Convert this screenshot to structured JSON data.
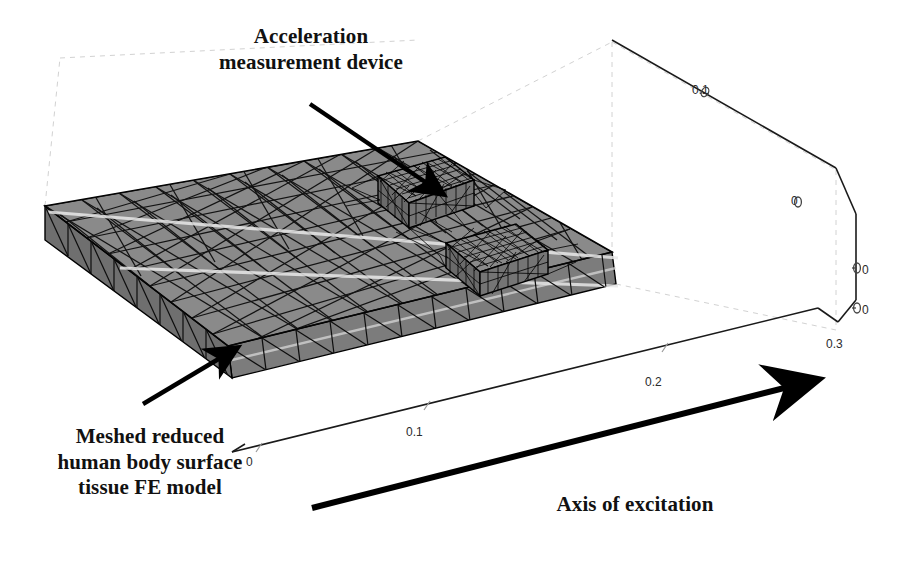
{
  "figure": {
    "title_alt": "3D finite element model of reduced human body surface tissue with acceleration measurement device",
    "background_color": "#ffffff",
    "slab_fill": "#8a8a8a",
    "mesh_line_color": "#000000",
    "axis_line_color": "#1a1a1a",
    "dashed_axis_color": "#cccccc",
    "annotation_color": "#111111"
  },
  "annotations": {
    "accelerometer": "Acceleration\nmeasurement device",
    "mesh_model": "Meshed reduced\nhuman body surface\ntissue FE model",
    "axis_of_excitation": "Axis of excitation"
  },
  "axes": {
    "bottom_axis": {
      "name": "x-axis",
      "ticks": [
        "0",
        "0.1",
        "0.2"
      ]
    },
    "right_depth_axis": {
      "name": "y-axis",
      "ticks": [
        "0.1",
        "0"
      ]
    },
    "right_vertical_axis": {
      "name": "z-axis",
      "ticks": [
        "0",
        "0",
        "0.3"
      ]
    }
  },
  "tick_labels": [
    {
      "id": "tick-x-0",
      "text": "0",
      "x": 246,
      "y": 455
    },
    {
      "id": "tick-x-01",
      "text": "0.1",
      "x": 406,
      "y": 425
    },
    {
      "id": "tick-x-02",
      "text": "0.2",
      "x": 645,
      "y": 375
    },
    {
      "id": "tick-y-01",
      "text": "0.1",
      "x": 692,
      "y": 83
    },
    {
      "id": "tick-y-0",
      "text": "0",
      "x": 791,
      "y": 194
    },
    {
      "id": "tick-z-0a",
      "text": "0",
      "x": 862,
      "y": 263
    },
    {
      "id": "tick-z-0b",
      "text": "0",
      "x": 862,
      "y": 303
    },
    {
      "id": "tick-z-03",
      "text": "0.3",
      "x": 826,
      "y": 337
    }
  ],
  "callouts": [
    {
      "id": "callout-accelerometer",
      "from": [
        310,
        104
      ],
      "to": [
        446,
        196
      ]
    },
    {
      "id": "callout-mesh",
      "from": [
        143,
        404
      ],
      "to": [
        240,
        346
      ]
    },
    {
      "id": "callout-excitation",
      "from": [
        312,
        508
      ],
      "to": [
        818,
        379
      ]
    }
  ],
  "device": {
    "label": "acceleration measurement device",
    "blocks": 2
  }
}
